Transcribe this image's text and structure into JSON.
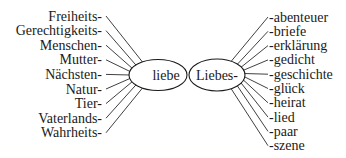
{
  "diagram": {
    "left_hub": {
      "label": "liebe",
      "cx": 158,
      "cy": 75,
      "rx": 29,
      "ry": 15.5,
      "prefixes": [
        "Freiheits-",
        "Gerechtigkeits-",
        "Menschen-",
        "Mutter-",
        "Nächsten-",
        "Natur-",
        "Tier-",
        "Vaterlands-",
        "Wahrheits-"
      ]
    },
    "right_hub": {
      "label": "Liebes-",
      "cx": 217,
      "cy": 75,
      "rx": 28,
      "ry": 16,
      "suffixes": [
        "-abenteuer",
        "-briefe",
        "-erklärung",
        "-gedicht",
        "-geschichte",
        "-glück",
        "-heirat",
        "-lied",
        "-paar",
        "-szene"
      ]
    },
    "colors": {
      "ink": "#1a1a1a",
      "background": "#ffffff"
    }
  }
}
